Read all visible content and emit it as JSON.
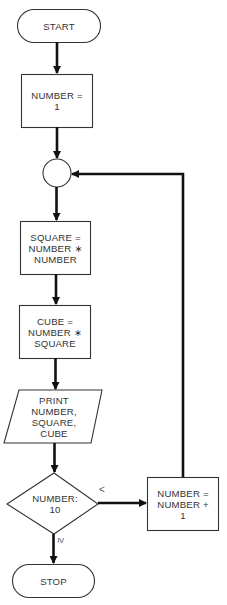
{
  "diagram": {
    "type": "flowchart",
    "nodes": [
      {
        "id": "start",
        "shape": "terminal",
        "label": "START"
      },
      {
        "id": "init",
        "shape": "process",
        "label": "NUMBER =\n1"
      },
      {
        "id": "connector",
        "shape": "connector",
        "label": ""
      },
      {
        "id": "square",
        "shape": "process",
        "label": "SQUARE =\nNUMBER ∗\nNUMBER"
      },
      {
        "id": "cube",
        "shape": "process",
        "label": "CUBE =\nNUMBER ∗\nSQUARE"
      },
      {
        "id": "print",
        "shape": "io",
        "label": "PRINT\nNUMBER,\nSQUARE,\nCUBE"
      },
      {
        "id": "decision",
        "shape": "decision",
        "label": "NUMBER:\n10"
      },
      {
        "id": "increment",
        "shape": "process",
        "label": "NUMBER =\nNUMBER +\n1"
      },
      {
        "id": "stop",
        "shape": "terminal",
        "label": "STOP"
      }
    ],
    "edges": [
      {
        "from": "start",
        "to": "init",
        "label": ""
      },
      {
        "from": "init",
        "to": "connector",
        "label": ""
      },
      {
        "from": "connector",
        "to": "square",
        "label": ""
      },
      {
        "from": "square",
        "to": "cube",
        "label": ""
      },
      {
        "from": "cube",
        "to": "print",
        "label": ""
      },
      {
        "from": "print",
        "to": "decision",
        "label": ""
      },
      {
        "from": "decision",
        "to": "increment",
        "label": "<"
      },
      {
        "from": "decision",
        "to": "stop",
        "label": "≥"
      },
      {
        "from": "increment",
        "to": "connector",
        "label": ""
      }
    ],
    "edge_labels": {
      "less_than": "<",
      "greater_equal": "≥"
    }
  }
}
